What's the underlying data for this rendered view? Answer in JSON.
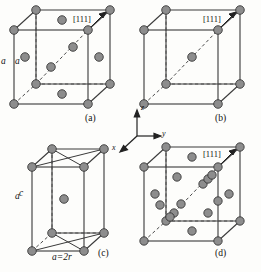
{
  "figure": {
    "background_color": "#fdfdfb",
    "line_color": "#3a3a3a",
    "atom_fill": "#8d8d8d",
    "atom_stroke": "#2b2b2b",
    "dashed_color": "#4a4a4a"
  },
  "panels": [
    {
      "id": "a",
      "caption": "(a)",
      "edge_label": "a",
      "direction_label": "[111]",
      "structure": "fcc",
      "atom_count_visible": 14,
      "diagonal_atoms": 2
    },
    {
      "id": "b",
      "caption": "(b)",
      "edge_label": "a",
      "direction_label": "[111]",
      "structure": "bcc",
      "atom_count_visible": 9,
      "diagonal_atoms": 1
    },
    {
      "id": "c",
      "caption": "(c)",
      "edge_label": "c",
      "base_label": "a=2r",
      "structure": "tetragonal",
      "atom_count_visible": 9,
      "diagonal_atoms": 1
    },
    {
      "id": "d",
      "caption": "(d)",
      "edge_label": "a",
      "direction_label": "[111]",
      "structure": "diamond-cubic",
      "atom_count_visible": 22,
      "diagonal_atoms": 5
    }
  ],
  "axes": {
    "z_label": "z",
    "y_label": "y",
    "x_label": "x"
  }
}
